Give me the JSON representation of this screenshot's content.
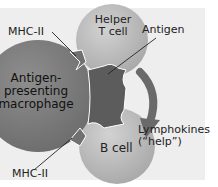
{
  "diagram": {
    "labels": {
      "mhc_top": "MHC-II",
      "helper_t_line1": "Helper",
      "helper_t_line2": "T cell",
      "antigen": "Antigen",
      "macrophage_line1": "Antigen-",
      "macrophage_line2": "presenting",
      "macrophage_line3": "macrophage",
      "b_cell": "B cell",
      "lymphokines_line1": "Lymphokines",
      "lymphokines_line2": "(“help”)",
      "mhc_bottom": "MHC-II"
    },
    "colors": {
      "background": "#eeeeee",
      "macrophage": "#7b7b7b",
      "helper_t_cell": "#bcbcbc",
      "b_cell": "#bcbcbc",
      "antigen": "#5c5c5c",
      "arrow": "#6a6a6a"
    }
  }
}
